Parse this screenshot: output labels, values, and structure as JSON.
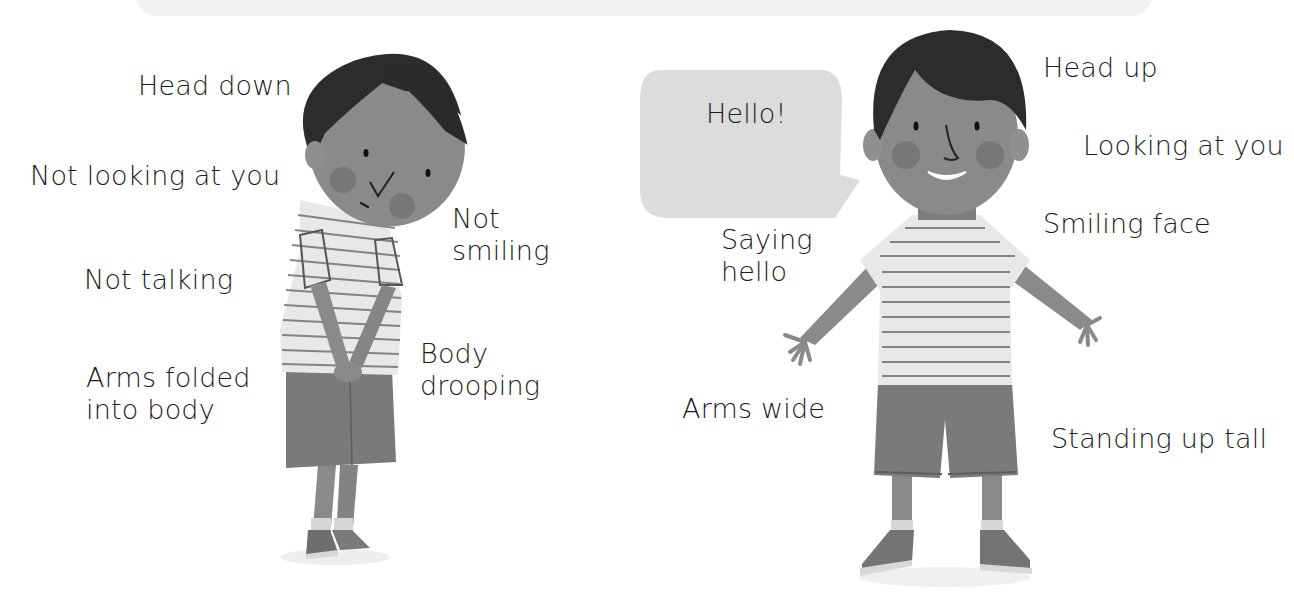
{
  "left_figure": {
    "description": "shy boy",
    "labels": {
      "head": "Head down",
      "eyes": "Not looking at you",
      "mouth": [
        "Not",
        "smiling"
      ],
      "talking": "Not talking",
      "arms": [
        "Arms folded",
        "into body"
      ],
      "body": [
        "Body",
        "drooping"
      ]
    }
  },
  "right_figure": {
    "description": "confident boy",
    "speech_bubble": "Hello!",
    "labels": {
      "head": "Head up",
      "eyes": "Looking at you",
      "mouth": "Smiling face",
      "talking": [
        "Saying",
        "hello"
      ],
      "arms": "Arms wide",
      "body": "Standing up tall"
    }
  },
  "colors": {
    "banner": "#f1f1f1",
    "skin": "#8a8a8a",
    "hair": "#2c2c2c",
    "cheek": "#6f6f6f",
    "shirt": "#e6e6e6",
    "stripe": "#6a6a6a",
    "shorts": "#777777",
    "bubble": "#dcdcdc",
    "text": "#1c1c1c"
  }
}
